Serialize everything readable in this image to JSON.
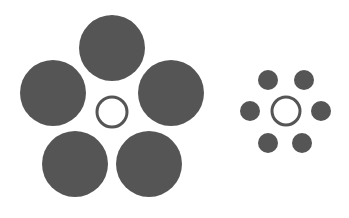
{
  "figure": {
    "background": "#ffffff",
    "fill_color": "#555555",
    "ring_color": "#555555",
    "left_group": {
      "center_ring": {
        "cx": 112,
        "cy": 112,
        "r": 15,
        "stroke": 3
      },
      "surrounding_circles": [
        {
          "cx": 112,
          "cy": 48,
          "r": 33
        },
        {
          "cx": 53,
          "cy": 93,
          "r": 33
        },
        {
          "cx": 171,
          "cy": 93,
          "r": 33
        },
        {
          "cx": 75,
          "cy": 164,
          "r": 33
        },
        {
          "cx": 149,
          "cy": 164,
          "r": 33
        }
      ]
    },
    "right_group": {
      "center_ring": {
        "cx": 286,
        "cy": 111,
        "r": 14,
        "stroke": 3
      },
      "surrounding_circles": [
        {
          "cx": 268,
          "cy": 80,
          "r": 10
        },
        {
          "cx": 304,
          "cy": 80,
          "r": 10
        },
        {
          "cx": 250,
          "cy": 111,
          "r": 10
        },
        {
          "cx": 321,
          "cy": 111,
          "r": 10
        },
        {
          "cx": 268,
          "cy": 143,
          "r": 10
        },
        {
          "cx": 302,
          "cy": 143,
          "r": 10
        }
      ]
    }
  }
}
